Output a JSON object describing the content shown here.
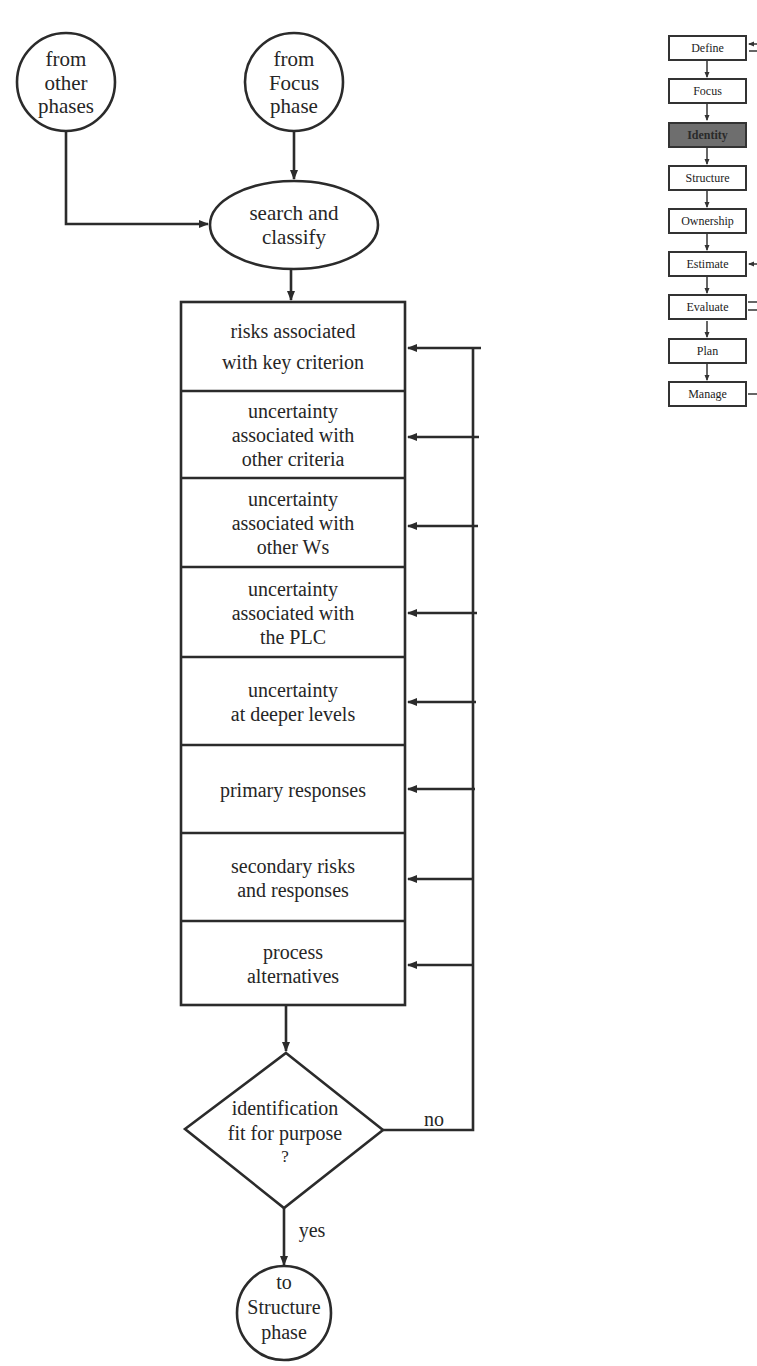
{
  "flowchart": {
    "start_nodes": [
      {
        "id": "from-other-phases",
        "lines": [
          "from",
          "other",
          "phases"
        ]
      },
      {
        "id": "from-focus-phase",
        "lines": [
          "from",
          "Focus",
          "phase"
        ]
      }
    ],
    "process_node": {
      "lines": [
        "search and",
        "classify"
      ]
    },
    "steps": [
      {
        "lines": [
          "risks associated",
          "with key criterion"
        ]
      },
      {
        "lines": [
          "uncertainty",
          "associated with",
          "other criteria"
        ]
      },
      {
        "lines": [
          "uncertainty",
          "associated with",
          "other Ws"
        ]
      },
      {
        "lines": [
          "uncertainty",
          "associated with",
          "the PLC"
        ]
      },
      {
        "lines": [
          "uncertainty",
          "at deeper levels"
        ]
      },
      {
        "lines": [
          "primary responses"
        ]
      },
      {
        "lines": [
          "secondary risks",
          "and responses"
        ]
      },
      {
        "lines": [
          "process",
          "alternatives"
        ]
      }
    ],
    "decision": {
      "lines": [
        "identification",
        "fit for purpose",
        "?"
      ],
      "no_label": "no",
      "yes_label": "yes"
    },
    "end_node": {
      "lines": [
        "to",
        "Structure",
        "phase"
      ]
    }
  },
  "phase_map": {
    "items": [
      {
        "label": "Define",
        "active": false
      },
      {
        "label": "Focus",
        "active": false
      },
      {
        "label": "Identity",
        "active": true
      },
      {
        "label": "Structure",
        "active": false
      },
      {
        "label": "Ownership",
        "active": false
      },
      {
        "label": "Estimate",
        "active": false
      },
      {
        "label": "Evaluate",
        "active": false
      },
      {
        "label": "Plan",
        "active": false
      },
      {
        "label": "Manage",
        "active": false
      }
    ]
  },
  "colors": {
    "line": "#2b2b2b",
    "active_fill": "#6e6e6e",
    "background": "#ffffff"
  }
}
